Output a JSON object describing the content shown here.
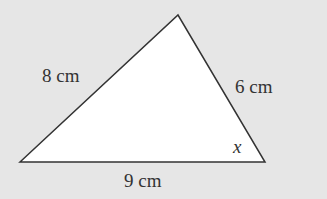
{
  "diagram": {
    "background": "#e6e6e6",
    "fill": "#ffffff",
    "stroke": "#333333",
    "vertices": {
      "left": [
        20,
        162
      ],
      "top": [
        178,
        15
      ],
      "right": [
        265,
        162
      ]
    },
    "labels": {
      "left_side": "8 cm",
      "right_side": "6 cm",
      "bottom_side": "9 cm",
      "angle": "x"
    }
  }
}
